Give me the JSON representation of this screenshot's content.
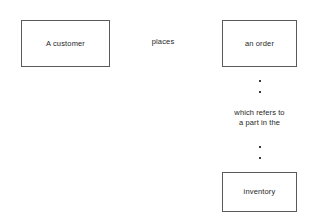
{
  "diagram": {
    "background_color": "#ffffff",
    "border_color": "#5a5a5a",
    "text_color": "#262626",
    "entities": [
      {
        "id": "customer",
        "label": "A customer"
      },
      {
        "id": "order",
        "label": "an order"
      },
      {
        "id": "inventory",
        "label": "inventory"
      }
    ],
    "relationships": [
      {
        "id": "places",
        "label": "places"
      },
      {
        "id": "refers",
        "line1": "which refers to",
        "line2": "a part in the"
      }
    ],
    "connector_dots": [
      {
        "id": "dot-1"
      },
      {
        "id": "dot-2"
      },
      {
        "id": "dot-3"
      },
      {
        "id": "dot-4"
      }
    ]
  }
}
